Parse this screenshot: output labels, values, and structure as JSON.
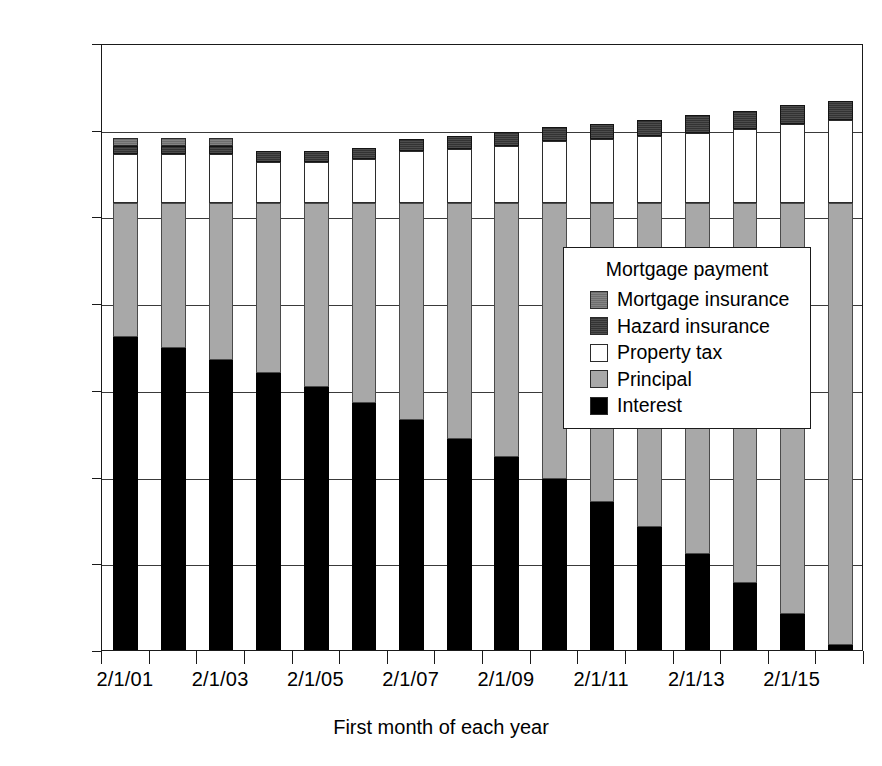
{
  "chart_data": {
    "type": "bar",
    "stacked": true,
    "title": "",
    "xlabel": "First month of each year",
    "ylabel": "",
    "ylim": [
      0,
      1400
    ],
    "ytick_step": 200,
    "ytick_labels": [
      "$0",
      "$200",
      "$400",
      "$600",
      "$800",
      "$1,000",
      "$1,200",
      "$1,400"
    ],
    "ytick_values": [
      0,
      200,
      400,
      600,
      800,
      1000,
      1200,
      1400
    ],
    "grid": true,
    "legend_position": "inside-right",
    "legend_title": "Mortgage payment",
    "categories": [
      "2/1/01",
      "2/1/02",
      "2/1/03",
      "2/1/04",
      "2/1/05",
      "2/1/06",
      "2/1/07",
      "2/1/08",
      "2/1/09",
      "2/1/10",
      "2/1/11",
      "2/1/12",
      "2/1/13",
      "2/1/14",
      "2/1/15",
      "2/1/16"
    ],
    "xtick_labels_shown": [
      "2/1/01",
      "2/1/03",
      "2/1/05",
      "2/1/07",
      "2/1/09",
      "2/1/11",
      "2/1/13",
      "2/1/15"
    ],
    "series": [
      {
        "name": "Interest",
        "color": "#000000",
        "values": [
          722,
          697,
          670,
          640,
          607,
          570,
          530,
          486,
          446,
          395,
          341,
          283,
          221,
          154,
          83,
          12
        ]
      },
      {
        "name": "Principal",
        "color": "#a8a8a8",
        "values": [
          308,
          333,
          360,
          390,
          423,
          460,
          500,
          544,
          584,
          635,
          689,
          747,
          809,
          876,
          947,
          1018
        ]
      },
      {
        "name": "Property tax",
        "color": "#ffffff",
        "values": [
          113,
          113,
          113,
          95,
          95,
          102,
          120,
          125,
          133,
          143,
          148,
          155,
          163,
          172,
          183,
          192
        ]
      },
      {
        "name": "Hazard insurance",
        "color": "#333333",
        "values": [
          20,
          20,
          20,
          26,
          26,
          27,
          28,
          30,
          32,
          33,
          35,
          37,
          40,
          42,
          45,
          45
        ]
      },
      {
        "name": "Mortgage insurance",
        "color": "#6e6e6e",
        "values": [
          19,
          19,
          19,
          0,
          0,
          0,
          0,
          0,
          0,
          0,
          0,
          0,
          0,
          0,
          0,
          0
        ]
      }
    ],
    "totals": [
      1182,
      1182,
      1182,
      1151,
      1151,
      1159,
      1178,
      1185,
      1195,
      1206,
      1213,
      1222,
      1233,
      1244,
      1258,
      1267
    ],
    "stack_order_bottom_to_top": [
      "Interest",
      "Principal",
      "Property tax",
      "Hazard insurance",
      "Mortgage insurance"
    ]
  },
  "legend": {
    "title": "Mortgage payment",
    "items": [
      {
        "label": "Mortgage insurance",
        "series": "Mortgage insurance"
      },
      {
        "label": "Hazard insurance",
        "series": "Hazard insurance"
      },
      {
        "label": "Property tax",
        "series": "Property tax"
      },
      {
        "label": "Principal",
        "series": "Principal"
      },
      {
        "label": "Interest",
        "series": "Interest"
      }
    ]
  }
}
